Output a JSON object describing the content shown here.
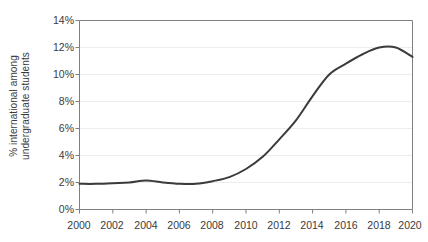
{
  "chart_data": {
    "type": "line",
    "title": "",
    "xlabel": "",
    "ylabel": "% international among undergraduate students",
    "ylabel_line1": "% international among",
    "ylabel_line2": "undergraduate students",
    "xlim": [
      2000,
      2020
    ],
    "ylim": [
      0,
      14
    ],
    "grid": true,
    "grid_axis": "y",
    "legend": "none",
    "y_tick_labels": [
      "0%",
      "2%",
      "4%",
      "6%",
      "8%",
      "10%",
      "12%",
      "14%"
    ],
    "y_tick_values": [
      0,
      2,
      4,
      6,
      8,
      10,
      12,
      14
    ],
    "x_tick_labels": [
      "2000",
      "2002",
      "2004",
      "2006",
      "2008",
      "2010",
      "2012",
      "2014",
      "2016",
      "2018",
      "2020"
    ],
    "x_tick_values": [
      2000,
      2002,
      2004,
      2006,
      2008,
      2010,
      2012,
      2014,
      2016,
      2018,
      2020
    ],
    "series": [
      {
        "name": "% international among undergraduate students",
        "color": "#3b3b3b",
        "x": [
          2000,
          2001,
          2002,
          2003,
          2004,
          2005,
          2006,
          2007,
          2008,
          2009,
          2010,
          2011,
          2012,
          2013,
          2014,
          2015,
          2016,
          2017,
          2018,
          2019,
          2020
        ],
        "values": [
          1.9,
          1.9,
          1.95,
          2.0,
          2.15,
          2.0,
          1.9,
          1.9,
          2.1,
          2.4,
          3.0,
          3.9,
          5.2,
          6.6,
          8.4,
          10.0,
          10.8,
          11.5,
          12.0,
          12.0,
          11.3
        ]
      }
    ]
  },
  "axes": {
    "line_color": "#3b3b3b",
    "grid_color": "#ededed",
    "axis_color": "#808080",
    "text_color": "#3a3a3a"
  }
}
